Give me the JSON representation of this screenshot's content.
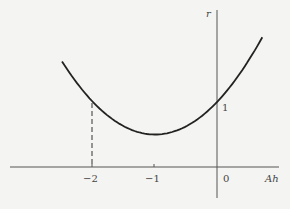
{
  "chart_data": {
    "type": "line",
    "title": "",
    "xlabel": "Ah",
    "ylabel": "r",
    "x_ticks": [
      "-2",
      "-1",
      "0"
    ],
    "y_ticks": [
      "1"
    ],
    "series": [
      {
        "name": "r(Ah) = 1 + Ah + (Ah)^2/2",
        "x": [
          -2.5,
          -2.0,
          -1.5,
          -1.0,
          -0.5,
          0.0,
          0.5,
          0.73
        ],
        "values": [
          1.625,
          1.0,
          0.625,
          0.5,
          0.625,
          1.0,
          1.625,
          2.0
        ]
      }
    ],
    "annotations": [
      {
        "type": "dashed-vertical-line",
        "x": -2,
        "from_y": 0,
        "to_y": 1
      }
    ],
    "grid": false,
    "legend": "none",
    "xlim": [
      -3.1,
      0.9
    ],
    "ylim": [
      -0.5,
      2.55
    ]
  },
  "labels": {
    "y_axis": "r",
    "x_axis": "Ah",
    "tick_neg2": "−2",
    "tick_neg1": "−1",
    "tick_0": "0",
    "tick_1": "1"
  }
}
